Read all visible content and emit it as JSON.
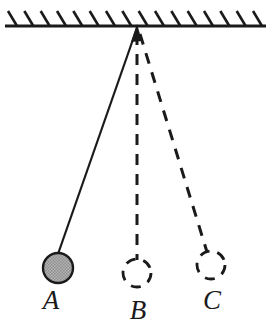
{
  "figure": {
    "type": "physics-diagram",
    "background_color": "#ffffff",
    "stroke_color": "#1a1a1a"
  },
  "ceiling": {
    "name": "hatched-support-ceiling",
    "line_color": "#1a1a1a",
    "line_width": 3,
    "x_start": 5,
    "x_end": 266,
    "y": 26,
    "hatch_count": 16,
    "hatch_length": 17,
    "hatch_dx": -9,
    "hatch_dy": -15,
    "hatch_width": 2.6
  },
  "pivot": {
    "name": "pivot-point",
    "x": 137,
    "y": 28,
    "arrow_color": "#1a1a1a"
  },
  "strings": [
    {
      "id": "string-a",
      "label": "A",
      "style": "solid",
      "stroke_width": 2.2,
      "x1": 137,
      "y1": 28,
      "x2": 58,
      "y2": 254
    },
    {
      "id": "string-b",
      "label": "B",
      "style": "dashed",
      "stroke_width": 3.0,
      "dash": "11 9",
      "x1": 137,
      "y1": 34,
      "x2": 137,
      "y2": 260
    },
    {
      "id": "string-c",
      "label": "C",
      "style": "dashed",
      "stroke_width": 3.0,
      "dash": "11 9",
      "x1": 140,
      "y1": 34,
      "x2": 207,
      "y2": 252
    }
  ],
  "bobs": [
    {
      "id": "bob-a",
      "label": "A",
      "style": "filled",
      "fill_color": "#a8a8a8",
      "stroke_color": "#1a1a1a",
      "stroke_width": 2.4,
      "cx": 58,
      "cy": 268,
      "r": 15
    },
    {
      "id": "bob-b",
      "label": "B",
      "style": "dashed-outline",
      "fill_color": "none",
      "stroke_color": "#1a1a1a",
      "stroke_width": 2.8,
      "dash": "10 8",
      "cx": 137,
      "cy": 273,
      "r": 14
    },
    {
      "id": "bob-c",
      "label": "C",
      "style": "dashed-outline",
      "fill_color": "none",
      "stroke_color": "#1a1a1a",
      "stroke_width": 2.8,
      "dash": "10 8",
      "cx": 211,
      "cy": 265,
      "r": 14
    }
  ],
  "labels": [
    {
      "id": "label-a",
      "text": "A",
      "x": 51,
      "y": 309,
      "font_size": 27
    },
    {
      "id": "label-b",
      "text": "B",
      "x": 138,
      "y": 319,
      "font_size": 27
    },
    {
      "id": "label-c",
      "text": "C",
      "x": 212,
      "y": 309,
      "font_size": 27
    }
  ]
}
